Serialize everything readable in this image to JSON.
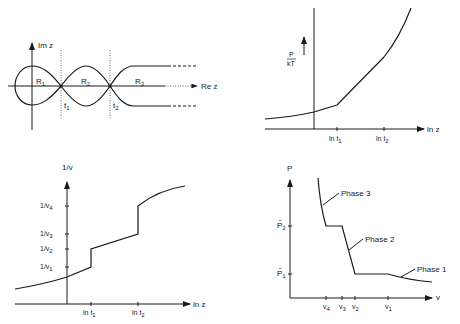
{
  "panels": {
    "complex_plane": {
      "y_axis_label": "Im z",
      "x_axis_label": "Re z",
      "regions": [
        "R",
        "R",
        "R"
      ],
      "region_subs": [
        "1",
        "2",
        "3"
      ],
      "points": [
        "t",
        "t"
      ],
      "point_subs": [
        "1",
        "2"
      ]
    },
    "pressure": {
      "y_label_num": "P",
      "y_label_den": "kT",
      "x_axis_label": "ln z",
      "ticks": [
        "ln t",
        "ln t"
      ],
      "tick_subs": [
        "1",
        "2"
      ]
    },
    "inverse_volume": {
      "y_axis_label": "1/v",
      "x_axis_label": "ln z",
      "y_ticks": [
        "1/v",
        "1/v",
        "1/v",
        "1/v"
      ],
      "y_tick_subs": [
        "4",
        "3",
        "2",
        "1"
      ],
      "x_ticks": [
        "ln t",
        "ln t"
      ],
      "x_tick_subs": [
        "1",
        "2"
      ]
    },
    "isotherm": {
      "y_axis_label": "P",
      "x_axis_label": "v",
      "y_ticks": [
        "P",
        "P"
      ],
      "y_tick_subs": [
        "2",
        "1"
      ],
      "x_ticks": [
        "v",
        "v",
        "v",
        "v"
      ],
      "x_tick_subs": [
        "4",
        "3",
        "2",
        "1"
      ],
      "phases": [
        "Phase 3",
        "Phase 2",
        "Phase 1"
      ]
    }
  }
}
